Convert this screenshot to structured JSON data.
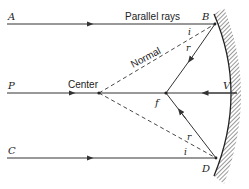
{
  "diagram": {
    "labels": {
      "ray_a": "A",
      "ray_p": "P",
      "ray_c": "C",
      "point_b": "B",
      "point_d": "D",
      "vertex": "V",
      "focus": "f",
      "center": "Center",
      "parallel_rays": "Parallel rays",
      "normal": "Normal",
      "incidence_top": "i",
      "reflection_top": "r",
      "incidence_bottom": "i",
      "reflection_bottom": "r"
    },
    "colors": {
      "line": "#333333",
      "background": "#ffffff"
    }
  }
}
